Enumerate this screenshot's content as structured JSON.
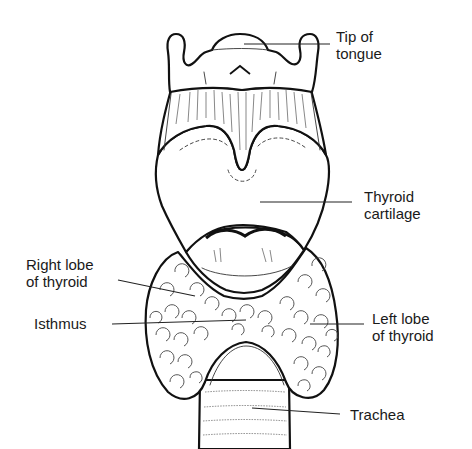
{
  "diagram": {
    "labels": {
      "tip_of_tongue": {
        "line1": "Tip of",
        "line2": "tongue"
      },
      "thyroid_cartilage": {
        "line1": "Thyroid",
        "line2": "cartilage"
      },
      "right_lobe": {
        "line1": "Right lobe",
        "line2": "of thyroid"
      },
      "isthmus": {
        "line1": "Isthmus"
      },
      "left_lobe": {
        "line1": "Left lobe",
        "line2": "of thyroid"
      },
      "trachea": {
        "line1": "Trachea"
      }
    },
    "colors": {
      "ink": "#111111",
      "background": "#ffffff"
    }
  }
}
